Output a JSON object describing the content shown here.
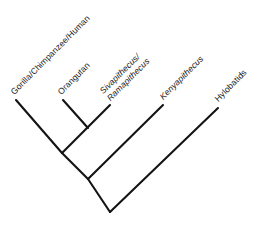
{
  "figure": {
    "type": "cladogram",
    "background_color": "#ffffff",
    "line_color": "#141414",
    "text_color": "#1a1a1a",
    "line_width": 2.1
  },
  "tips": [
    {
      "id": "gorilla-chimpanzee-human",
      "label": "Gorilla/Chimpanzee/Human",
      "label_line2": "",
      "italic": false,
      "rotation_deg": -45,
      "label_x": 16,
      "label_y": 97,
      "tip_x": 16,
      "tip_y": 100
    },
    {
      "id": "orangutan",
      "label": "Orangutan",
      "label_line2": "",
      "italic": false,
      "rotation_deg": -45,
      "label_x": 63,
      "label_y": 97,
      "tip_x": 63,
      "tip_y": 100
    },
    {
      "id": "sivapithecus-ramapithecus",
      "label": "Sivapithecus/",
      "label_line2": "Ramapithecus",
      "italic": true,
      "rotation_deg": -45,
      "label_x": 112,
      "label_y": 103,
      "tip_x": 110,
      "tip_y": 105
    },
    {
      "id": "kenyapithecus",
      "label": "Kenyapithecus",
      "label_line2": "",
      "italic": true,
      "rotation_deg": -45,
      "label_x": 165,
      "label_y": 102,
      "tip_x": 163,
      "tip_y": 105
    },
    {
      "id": "hylobatids",
      "label": "Hylobatids",
      "label_line2": "",
      "italic": false,
      "rotation_deg": -45,
      "label_x": 220,
      "label_y": 104,
      "tip_x": 218,
      "tip_y": 108
    }
  ],
  "nodes": [
    {
      "id": "node-orangutan-sivapithecus",
      "x": 88,
      "y": 128
    },
    {
      "id": "node-great-apes",
      "x": 62,
      "y": 153
    },
    {
      "id": "node-kenyapithecus-clade",
      "x": 88,
      "y": 179
    },
    {
      "id": "node-root",
      "x": 110,
      "y": 212
    }
  ],
  "branches": [
    {
      "id": "branch-gorilla-chimpanzee-human",
      "x1": 16,
      "y1": 100,
      "x2": 62,
      "y2": 153
    },
    {
      "id": "branch-orangutan",
      "x1": 63,
      "y1": 100,
      "x2": 88,
      "y2": 128
    },
    {
      "id": "branch-sivapithecus-ramapithecus",
      "x1": 110,
      "y1": 105,
      "x2": 62,
      "y2": 153
    },
    {
      "id": "branch-kenyapithecus",
      "x1": 163,
      "y1": 105,
      "x2": 88,
      "y2": 179
    },
    {
      "id": "branch-great-apes-stem",
      "x1": 62,
      "y1": 153,
      "x2": 88,
      "y2": 179
    },
    {
      "id": "branch-kenyapithecus-clade-stem",
      "x1": 88,
      "y1": 179,
      "x2": 110,
      "y2": 212
    },
    {
      "id": "branch-hylobatids",
      "x1": 218,
      "y1": 108,
      "x2": 110,
      "y2": 212
    }
  ]
}
